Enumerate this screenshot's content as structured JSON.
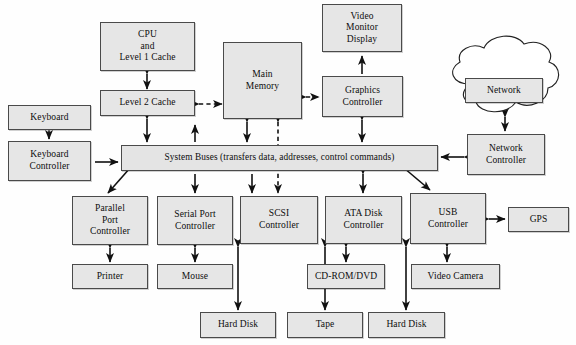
{
  "diagram": {
    "nodes": {
      "cpu": {
        "label": "CPU\nand\nLevel 1 Cache"
      },
      "l2cache": {
        "label": "Level 2 Cache"
      },
      "main_memory": {
        "label": "Main\nMemory"
      },
      "video_monitor": {
        "label": "Video\nMonitor\nDisplay"
      },
      "graphics_controller": {
        "label": "Graphics\nController"
      },
      "network_cloud": {
        "label": "Network"
      },
      "network_controller": {
        "label": "Network\nController"
      },
      "keyboard": {
        "label": "Keyboard"
      },
      "keyboard_controller": {
        "label": "Keyboard\nController"
      },
      "system_buses": {
        "label": "System Buses (transfers data, addresses, control commands)"
      },
      "parallel_port_controller": {
        "label": "Parallel\nPort\nController"
      },
      "serial_port_controller": {
        "label": "Serial Port\nController"
      },
      "scsi_controller": {
        "label": "SCSI\nController"
      },
      "ata_disk_controller": {
        "label": "ATA Disk\nController"
      },
      "usb_controller": {
        "label": "USB\nController"
      },
      "gps": {
        "label": "GPS"
      },
      "printer": {
        "label": "Printer"
      },
      "mouse": {
        "label": "Mouse"
      },
      "cdrom_dvd": {
        "label": "CD-ROM/DVD"
      },
      "video_camera": {
        "label": "Video Camera"
      },
      "hard_disk_scsi": {
        "label": "Hard Disk"
      },
      "tape": {
        "label": "Tape"
      },
      "hard_disk_ata": {
        "label": "Hard Disk"
      }
    },
    "colors": {
      "node_fill": "#e6e6e6",
      "node_border": "#4a4a4a",
      "wire": "#111111",
      "background": "#ffffff"
    },
    "connections": [
      {
        "from": "cpu",
        "to": "l2cache",
        "style": "solid",
        "arrows": "both"
      },
      {
        "from": "l2cache",
        "to": "main_memory",
        "style": "dashed",
        "arrows": "both"
      },
      {
        "from": "l2cache",
        "to": "system_buses",
        "style": "solid",
        "arrows": "both"
      },
      {
        "from": "main_memory",
        "to": "graphics_controller",
        "style": "dashed",
        "arrows": "both"
      },
      {
        "from": "main_memory",
        "to": "system_buses",
        "style": "solid",
        "arrows": "both"
      },
      {
        "from": "main_memory",
        "to": "scsi_controller",
        "style": "dashed",
        "arrows": "both"
      },
      {
        "from": "graphics_controller",
        "to": "video_monitor",
        "style": "solid",
        "arrows": "end"
      },
      {
        "from": "graphics_controller",
        "to": "system_buses",
        "style": "solid",
        "arrows": "both"
      },
      {
        "from": "network_cloud",
        "to": "network_controller",
        "style": "solid",
        "arrows": "both"
      },
      {
        "from": "network_controller",
        "to": "system_buses",
        "style": "solid",
        "arrows": "both"
      },
      {
        "from": "keyboard",
        "to": "keyboard_controller",
        "style": "solid",
        "arrows": "both"
      },
      {
        "from": "keyboard_controller",
        "to": "system_buses",
        "style": "solid",
        "arrows": "end"
      },
      {
        "from": "system_buses",
        "to": "parallel_port_controller",
        "style": "solid",
        "arrows": "both"
      },
      {
        "from": "system_buses",
        "to": "serial_port_controller",
        "style": "solid",
        "arrows": "both"
      },
      {
        "from": "system_buses",
        "to": "ata_disk_controller",
        "style": "solid",
        "arrows": "both"
      },
      {
        "from": "system_buses",
        "to": "usb_controller",
        "style": "solid",
        "arrows": "both"
      },
      {
        "from": "parallel_port_controller",
        "to": "printer",
        "style": "solid",
        "arrows": "both"
      },
      {
        "from": "serial_port_controller",
        "to": "mouse",
        "style": "solid",
        "arrows": "both"
      },
      {
        "from": "scsi_controller",
        "to": "hard_disk_scsi",
        "style": "solid",
        "arrows": "both"
      },
      {
        "from": "scsi_controller",
        "to": "tape",
        "style": "solid",
        "arrows": "both"
      },
      {
        "from": "ata_disk_controller",
        "to": "cdrom_dvd",
        "style": "solid",
        "arrows": "both"
      },
      {
        "from": "ata_disk_controller",
        "to": "hard_disk_ata",
        "style": "solid",
        "arrows": "both"
      },
      {
        "from": "usb_controller",
        "to": "gps",
        "style": "solid",
        "arrows": "both"
      },
      {
        "from": "usb_controller",
        "to": "video_camera",
        "style": "solid",
        "arrows": "both"
      }
    ]
  }
}
